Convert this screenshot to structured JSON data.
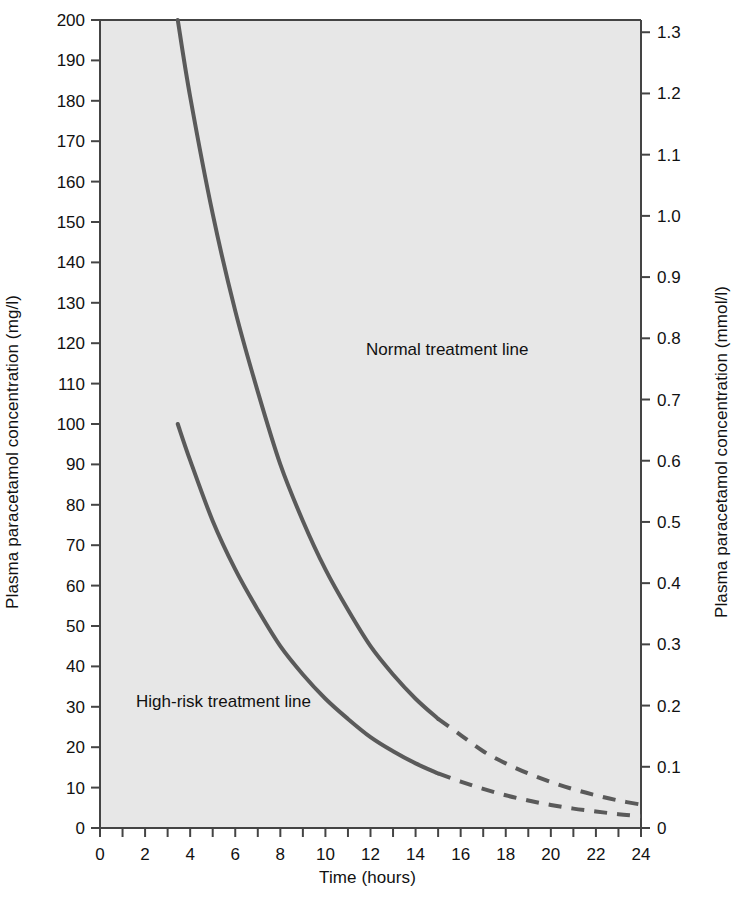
{
  "chart_data": {
    "type": "line",
    "title": "",
    "xlabel": "Time (hours)",
    "ylabel": "Plasma paracetamol concentration (mg/l)",
    "ylabel_right": "Plasma paracetamol concentration (mmol/l)",
    "xlim": [
      0,
      24
    ],
    "ylim": [
      0,
      200
    ],
    "ylim_right": [
      0,
      1.32
    ],
    "grid": false,
    "legend_position": "inline-annotations",
    "plot_background": "#e7e7e7",
    "line_color": "#5a5a5a",
    "x_ticks": [
      0,
      1,
      2,
      3,
      4,
      5,
      6,
      7,
      8,
      9,
      10,
      11,
      12,
      13,
      14,
      15,
      16,
      17,
      18,
      19,
      20,
      21,
      22,
      23,
      24
    ],
    "x_tick_labels": [
      "0",
      "",
      "2",
      "",
      "4",
      "",
      "6",
      "",
      "8",
      "",
      "10",
      "",
      "12",
      "",
      "14",
      "",
      "16",
      "",
      "18",
      "",
      "20",
      "",
      "22",
      "",
      "24"
    ],
    "y_ticks_left": [
      0,
      10,
      20,
      30,
      40,
      50,
      60,
      70,
      80,
      90,
      100,
      110,
      120,
      130,
      140,
      150,
      160,
      170,
      180,
      190,
      200
    ],
    "y_tick_labels_left": [
      "0",
      "10",
      "20",
      "30",
      "40",
      "50",
      "60",
      "70",
      "80",
      "90",
      "100",
      "110",
      "120",
      "130",
      "140",
      "150",
      "160",
      "170",
      "180",
      "190",
      "200"
    ],
    "y_ticks_right": [
      0,
      0.1,
      0.2,
      0.3,
      0.4,
      0.5,
      0.6,
      0.7,
      0.8,
      0.9,
      1.0,
      1.1,
      1.2,
      1.3
    ],
    "y_tick_labels_right": [
      "0",
      "0.1",
      "0.2",
      "0.3",
      "0.4",
      "0.5",
      "0.6",
      "0.7",
      "0.8",
      "0.9",
      "1.0",
      "1.1",
      "1.2",
      "1.3"
    ],
    "series": [
      {
        "name": "Normal treatment line",
        "label": "Normal treatment line",
        "label_x": 11.8,
        "label_y": 117,
        "solid_until_x": 15,
        "points": [
          {
            "x": 3.45,
            "y": 200
          },
          {
            "x": 4,
            "y": 181
          },
          {
            "x": 5,
            "y": 152
          },
          {
            "x": 6,
            "y": 128
          },
          {
            "x": 7,
            "y": 108
          },
          {
            "x": 8,
            "y": 90
          },
          {
            "x": 9,
            "y": 76
          },
          {
            "x": 10,
            "y": 64
          },
          {
            "x": 11,
            "y": 54
          },
          {
            "x": 12,
            "y": 45
          },
          {
            "x": 13,
            "y": 38
          },
          {
            "x": 14,
            "y": 32
          },
          {
            "x": 15,
            "y": 27
          },
          {
            "x": 16,
            "y": 23
          },
          {
            "x": 17,
            "y": 19
          },
          {
            "x": 18,
            "y": 16
          },
          {
            "x": 19,
            "y": 13.5
          },
          {
            "x": 20,
            "y": 11.4
          },
          {
            "x": 21,
            "y": 9.6
          },
          {
            "x": 22,
            "y": 8.1
          },
          {
            "x": 23,
            "y": 6.8
          },
          {
            "x": 24,
            "y": 5.8
          }
        ]
      },
      {
        "name": "High-risk treatment line",
        "label": "High-risk treatment line",
        "label_x": 1.6,
        "label_y": 30,
        "solid_until_x": 15,
        "points": [
          {
            "x": 3.45,
            "y": 100
          },
          {
            "x": 4,
            "y": 91
          },
          {
            "x": 5,
            "y": 76
          },
          {
            "x": 6,
            "y": 64
          },
          {
            "x": 7,
            "y": 54
          },
          {
            "x": 8,
            "y": 45
          },
          {
            "x": 9,
            "y": 38
          },
          {
            "x": 10,
            "y": 32
          },
          {
            "x": 11,
            "y": 27
          },
          {
            "x": 12,
            "y": 22.5
          },
          {
            "x": 13,
            "y": 19
          },
          {
            "x": 14,
            "y": 16
          },
          {
            "x": 15,
            "y": 13.5
          },
          {
            "x": 16,
            "y": 11.5
          },
          {
            "x": 17,
            "y": 9.7
          },
          {
            "x": 18,
            "y": 8.1
          },
          {
            "x": 19,
            "y": 6.8
          },
          {
            "x": 20,
            "y": 5.7
          },
          {
            "x": 21,
            "y": 4.8
          },
          {
            "x": 22,
            "y": 4.1
          },
          {
            "x": 23,
            "y": 3.4
          },
          {
            "x": 24,
            "y": 2.9
          }
        ]
      }
    ]
  }
}
